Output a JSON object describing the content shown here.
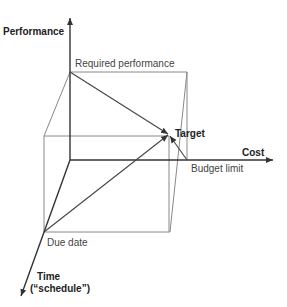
{
  "diagram": {
    "axes": {
      "performance": "Performance",
      "cost": "Cost",
      "time_line1": "Time",
      "time_line2": "(“schedule”)"
    },
    "points": {
      "required_performance": "Required performance",
      "target": "Target",
      "budget_limit": "Budget limit",
      "due_date": "Due date"
    },
    "colors": {
      "axis": "#333333",
      "box": "#888888",
      "vector": "#444444"
    }
  }
}
